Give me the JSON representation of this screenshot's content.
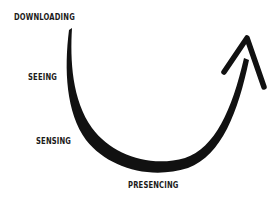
{
  "diagram": {
    "title": "",
    "stages": [
      {
        "label": "DOWNLOADING"
      },
      {
        "label": "SEEING"
      },
      {
        "label": "SENSING"
      },
      {
        "label": "PRESENCING"
      }
    ],
    "arrow": {
      "shape": "u-curve",
      "direction": "up-right",
      "color": "#111111"
    },
    "text_color": "#1a1a1a",
    "background": "#ffffff"
  }
}
